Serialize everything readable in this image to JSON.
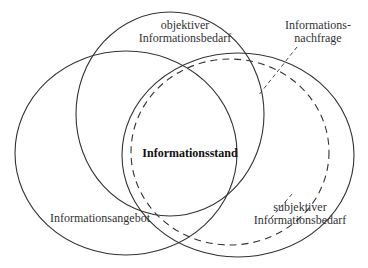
{
  "diagram": {
    "type": "venn",
    "sets": [
      {
        "id": "informationsangebot",
        "label": "Informationsangebot",
        "style": "solid"
      },
      {
        "id": "objektiver-bedarf",
        "label_line1": "objektiver",
        "label_line2": "Informationsbedarf",
        "style": "solid"
      },
      {
        "id": "subjektiver-bedarf",
        "label_line1": "subjektiver",
        "label_line2": "Informationsbedarf",
        "style": "solid"
      },
      {
        "id": "informationsnachfrage",
        "label_line1": "Informations-",
        "label_line2": "nachfrage",
        "style": "dashed"
      }
    ],
    "center_label": "Informationsstand",
    "line_color": "#333333"
  }
}
